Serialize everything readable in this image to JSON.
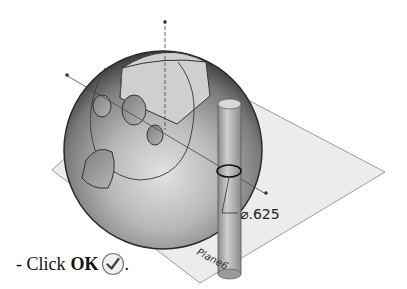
{
  "figure": {
    "dimension_label": "⌀.625",
    "plane_label": "Plane6"
  },
  "instruction": {
    "prefix": "- Click",
    "button_label": "OK",
    "suffix": ".",
    "icon": "ok-checkmark-icon"
  }
}
